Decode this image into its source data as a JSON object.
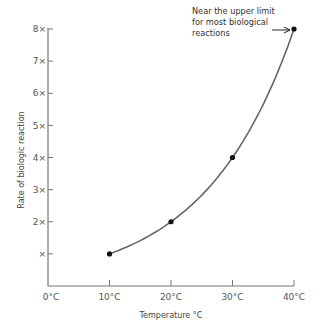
{
  "chart_data": {
    "type": "line",
    "title": "",
    "xlabel": "Temperature °C",
    "ylabel": "Rate of biologic reaction",
    "x_ticks": [
      "0°C",
      "10°C",
      "20°C",
      "30°C",
      "40°C"
    ],
    "y_ticks": [
      "×",
      "2×",
      "3×",
      "4×",
      "5×",
      "6×",
      "7×",
      "8×"
    ],
    "xlim": [
      0,
      40
    ],
    "ylim": [
      0,
      8
    ],
    "grid": false,
    "series": [
      {
        "name": "Rate of biologic reaction",
        "x": [
          10,
          20,
          30,
          40
        ],
        "values": [
          1,
          2,
          4,
          8
        ],
        "color": "#555555",
        "markers": true
      }
    ],
    "annotations": [
      {
        "text": [
          "Near the upper limit",
          "for most biological",
          "reactions"
        ],
        "points_to": {
          "x": 40,
          "y": 8
        },
        "arrow": true
      }
    ]
  },
  "colors": {
    "axis": "#777777",
    "curve": "#666666",
    "marker": "#111111",
    "text": "#555555"
  }
}
